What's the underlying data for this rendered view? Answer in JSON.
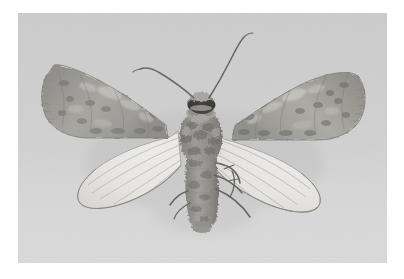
{
  "page": {
    "background_color": "#ffffff",
    "width": 404,
    "height": 279
  },
  "photo": {
    "name": "moth-specimen-photograph",
    "subject": "moth",
    "view": "dorsal, wings spread",
    "color_mode": "grayscale",
    "frame": {
      "x": 18,
      "y": 13,
      "width": 369,
      "height": 250
    },
    "background_color": "#d2d2d2",
    "background_color_lower": "#dcdcdc",
    "colors": {
      "forewing_dark": "#8d8b87",
      "forewing_mid": "#a5a39e",
      "forewing_light": "#c0beb8",
      "hindwing_pale": "#efeeea",
      "hindwing_vein": "#9a9893",
      "body_dark": "#6f6d69",
      "body_mid": "#908e89",
      "eye_dark": "#3a3836",
      "antenna": "#6b6965",
      "shadow": "#c2c2c2"
    },
    "parts": [
      {
        "label": "left-forewing",
        "description": "mottled grey-brown forewing with pale patches and a scalloped outer margin"
      },
      {
        "label": "right-forewing",
        "description": "mottled grey-brown forewing with pale patches and a scalloped outer margin"
      },
      {
        "label": "left-hindwing",
        "description": "pale translucent hindwing with fine radiating veins"
      },
      {
        "label": "right-hindwing",
        "description": "pale translucent hindwing with fine radiating veins"
      },
      {
        "label": "thorax",
        "description": "fuzzy dark-speckled thorax"
      },
      {
        "label": "abdomen",
        "description": "tapering segmented abdomen"
      },
      {
        "label": "head",
        "description": "small head with dark compound eyes and pale scale tuft"
      },
      {
        "label": "left-antenna",
        "description": "thin antenna curving up and to the left, bending at the tip"
      },
      {
        "label": "right-antenna",
        "description": "thin antenna curving up and to the right in a long S-curve"
      },
      {
        "label": "legs",
        "description": "slender dark legs projecting from the lower right of the body"
      }
    ]
  }
}
